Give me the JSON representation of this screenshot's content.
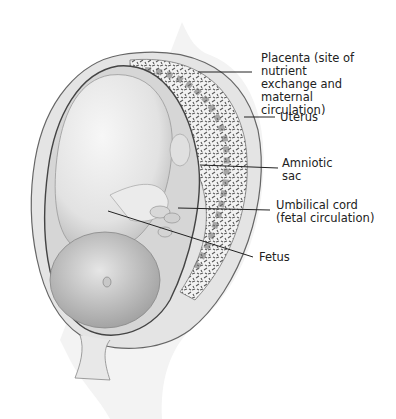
{
  "diagram": {
    "labels": [
      {
        "id": "placenta",
        "text": "Placenta (site of nutrient\nexchange and maternal\ncirculation)"
      },
      {
        "id": "uterus",
        "text": "Uterus"
      },
      {
        "id": "amniotic-sac",
        "text": "Amniotic\nsac"
      },
      {
        "id": "umbilical-cord",
        "text": "Umbilical cord\n(fetal circulation)"
      },
      {
        "id": "fetus",
        "text": "Fetus"
      }
    ]
  },
  "colors": {
    "background": "#ffffff",
    "outline": "#555555",
    "uterus_wall": "#e4e4e4",
    "placenta_dark": "#6a6a6a",
    "fetus_skin": "#e8e8e8",
    "amniotic_fluid": "#d6d6d6",
    "leader_line": "#222222"
  }
}
